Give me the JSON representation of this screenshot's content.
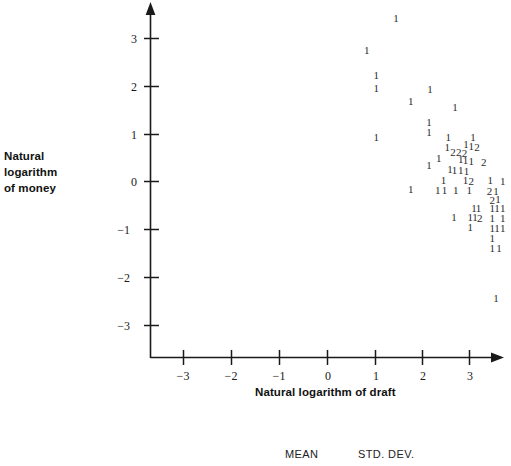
{
  "chart_data": {
    "type": "scatter",
    "title": "",
    "xlabel": "Natural logarithm of draft",
    "ylabel": "Natural logarithm of money",
    "ylabel_lines": [
      "Natural",
      "logarithm",
      "of money"
    ],
    "xlim": [
      -3.6,
      3.4
    ],
    "ylim": [
      -3.7,
      3.6
    ],
    "xticks": [
      -3,
      -2,
      -1,
      0,
      1,
      2,
      3
    ],
    "xticklabels": [
      "−3",
      "−2",
      "−1",
      "0",
      "1",
      "2",
      "3"
    ],
    "yticks": [
      -3,
      -2,
      -1,
      0,
      1,
      2,
      3
    ],
    "yticklabels": [
      "−3",
      "−2",
      "−1",
      "0",
      "1",
      "2",
      "3"
    ],
    "grid": false,
    "legend": null,
    "marker_style": "count-digit",
    "note": "Each plotted glyph is the count of observations at that location",
    "points": [
      {
        "x": 1.43,
        "y": 3.39,
        "label": "1"
      },
      {
        "x": 0.82,
        "y": 2.74,
        "label": "1"
      },
      {
        "x": 1.02,
        "y": 2.2,
        "label": "1"
      },
      {
        "x": 1.02,
        "y": 1.94,
        "label": "1"
      },
      {
        "x": 2.14,
        "y": 1.92,
        "label": "1"
      },
      {
        "x": 1.74,
        "y": 1.67,
        "label": "1"
      },
      {
        "x": 2.66,
        "y": 1.54,
        "label": "1"
      },
      {
        "x": 2.12,
        "y": 1.22,
        "label": "1"
      },
      {
        "x": 2.12,
        "y": 1.02,
        "label": "1"
      },
      {
        "x": 1.02,
        "y": 0.9,
        "label": "1"
      },
      {
        "x": 2.52,
        "y": 0.92,
        "label": "1"
      },
      {
        "x": 3.04,
        "y": 0.9,
        "label": "1"
      },
      {
        "x": 2.5,
        "y": 0.7,
        "label": "1"
      },
      {
        "x": 2.89,
        "y": 0.77,
        "label": "1"
      },
      {
        "x": 3.0,
        "y": 0.73,
        "label": "1"
      },
      {
        "x": 3.12,
        "y": 0.71,
        "label": "2"
      },
      {
        "x": 2.62,
        "y": 0.59,
        "label": "2"
      },
      {
        "x": 2.74,
        "y": 0.59,
        "label": "2"
      },
      {
        "x": 2.86,
        "y": 0.57,
        "label": "2"
      },
      {
        "x": 2.32,
        "y": 0.47,
        "label": "1"
      },
      {
        "x": 2.78,
        "y": 0.44,
        "label": "1"
      },
      {
        "x": 2.88,
        "y": 0.42,
        "label": "1"
      },
      {
        "x": 3.0,
        "y": 0.41,
        "label": "1"
      },
      {
        "x": 3.26,
        "y": 0.38,
        "label": "2"
      },
      {
        "x": 2.12,
        "y": 0.33,
        "label": "1"
      },
      {
        "x": 2.56,
        "y": 0.25,
        "label": "1"
      },
      {
        "x": 2.65,
        "y": 0.23,
        "label": "1"
      },
      {
        "x": 2.78,
        "y": 0.21,
        "label": "1"
      },
      {
        "x": 2.9,
        "y": 0.19,
        "label": "1"
      },
      {
        "x": 2.42,
        "y": 0.02,
        "label": "1"
      },
      {
        "x": 2.88,
        "y": 0.01,
        "label": "1"
      },
      {
        "x": 3.0,
        "y": -0.02,
        "label": "2"
      },
      {
        "x": 3.4,
        "y": 0.01,
        "label": "1"
      },
      {
        "x": 3.66,
        "y": 0.0,
        "label": "1"
      },
      {
        "x": 1.74,
        "y": -0.17,
        "label": "1"
      },
      {
        "x": 2.3,
        "y": -0.19,
        "label": "1"
      },
      {
        "x": 2.44,
        "y": -0.19,
        "label": "1"
      },
      {
        "x": 2.68,
        "y": -0.2,
        "label": "1"
      },
      {
        "x": 2.96,
        "y": -0.2,
        "label": "1"
      },
      {
        "x": 3.38,
        "y": -0.22,
        "label": "2"
      },
      {
        "x": 3.52,
        "y": -0.23,
        "label": "1"
      },
      {
        "x": 3.44,
        "y": -0.4,
        "label": "2"
      },
      {
        "x": 3.56,
        "y": -0.38,
        "label": "1"
      },
      {
        "x": 3.06,
        "y": -0.57,
        "label": "1"
      },
      {
        "x": 3.15,
        "y": -0.57,
        "label": "1"
      },
      {
        "x": 3.44,
        "y": -0.58,
        "label": "1"
      },
      {
        "x": 3.54,
        "y": -0.58,
        "label": "1"
      },
      {
        "x": 3.66,
        "y": -0.58,
        "label": "1"
      },
      {
        "x": 2.64,
        "y": -0.76,
        "label": "1"
      },
      {
        "x": 2.98,
        "y": -0.77,
        "label": "1"
      },
      {
        "x": 3.08,
        "y": -0.77,
        "label": "1"
      },
      {
        "x": 3.18,
        "y": -0.78,
        "label": "2"
      },
      {
        "x": 3.44,
        "y": -0.78,
        "label": "1"
      },
      {
        "x": 3.66,
        "y": -0.78,
        "label": "1"
      },
      {
        "x": 2.98,
        "y": -0.98,
        "label": "1"
      },
      {
        "x": 3.44,
        "y": -0.99,
        "label": "1"
      },
      {
        "x": 3.54,
        "y": -0.99,
        "label": "1"
      },
      {
        "x": 3.66,
        "y": -0.99,
        "label": "1"
      },
      {
        "x": 3.44,
        "y": -1.2,
        "label": "1"
      },
      {
        "x": 3.44,
        "y": -1.42,
        "label": "1"
      },
      {
        "x": 3.58,
        "y": -1.42,
        "label": "1"
      },
      {
        "x": 3.52,
        "y": -2.46,
        "label": "1"
      }
    ]
  },
  "footer": {
    "mean_label": "MEAN",
    "std_dev_label": "STD. DEV."
  },
  "axis": {
    "x_title": "Natural logarithm of draft",
    "y_title_line1": "Natural",
    "y_title_line2": "logarithm",
    "y_title_line3": "of money"
  },
  "colors": {
    "axis": "#1a1a1a",
    "text": "#111111",
    "point": "#2b2b2b",
    "background": "#ffffff"
  }
}
